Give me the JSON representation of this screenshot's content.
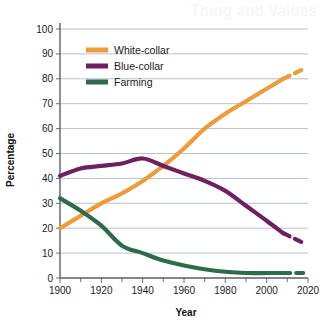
{
  "background_text": "Thing and Values",
  "chart_data": {
    "type": "line",
    "title": "",
    "xlabel": "Year",
    "ylabel": "Percentage",
    "xlim": [
      1900,
      2020
    ],
    "ylim": [
      0,
      100
    ],
    "xticks": [
      1900,
      1920,
      1940,
      1960,
      1980,
      2000,
      2020
    ],
    "xtick_labels": [
      "1900",
      "1920",
      "1940",
      "1960",
      "1980",
      "2000",
      "2020"
    ],
    "yticks": [
      0,
      10,
      20,
      30,
      40,
      50,
      60,
      70,
      80,
      90,
      100
    ],
    "ytick_labels": [
      "0",
      "10",
      "20",
      "30",
      "40",
      "50",
      "60",
      "70",
      "80",
      "90",
      "100"
    ],
    "grid": true,
    "grid_axis": "y",
    "legend_position": "upper-left-inside",
    "minor_xtick_interval": 10,
    "series": [
      {
        "name": "White-collar",
        "color": "#ee9b3c",
        "x": [
          1900,
          1910,
          1920,
          1930,
          1940,
          1950,
          1960,
          1970,
          1980,
          1990,
          2000,
          2008
        ],
        "values": [
          20,
          25,
          30,
          34,
          39,
          45,
          52,
          60,
          66,
          71,
          76,
          80
        ],
        "projection_x": [
          2008,
          2018
        ],
        "projection_values": [
          80,
          84
        ],
        "projection_style": "dashed"
      },
      {
        "name": "Blue-collar",
        "color": "#6e2060",
        "x": [
          1900,
          1910,
          1920,
          1930,
          1940,
          1950,
          1960,
          1970,
          1980,
          1990,
          2000,
          2008
        ],
        "values": [
          41,
          44,
          45,
          46,
          48,
          45,
          42,
          39,
          35,
          29,
          23,
          18
        ],
        "projection_x": [
          2008,
          2018
        ],
        "projection_values": [
          18,
          14
        ],
        "projection_style": "dashed"
      },
      {
        "name": "Farming",
        "color": "#2e6b4a",
        "x": [
          1900,
          1910,
          1920,
          1930,
          1940,
          1950,
          1960,
          1970,
          1980,
          1990,
          2000,
          2008
        ],
        "values": [
          32,
          27,
          21,
          13,
          10,
          7,
          5,
          3.5,
          2.5,
          2,
          2,
          2
        ],
        "projection_x": [
          2008,
          2018
        ],
        "projection_values": [
          2,
          2
        ],
        "projection_style": "dashed"
      }
    ]
  }
}
